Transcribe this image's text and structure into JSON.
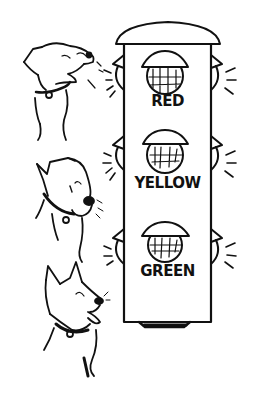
{
  "illustration": {
    "subject": "Three dogs beside a traffic light",
    "traffic_light": {
      "lights": [
        {
          "label": "RED"
        },
        {
          "label": "YELLOW"
        },
        {
          "label": "GREEN"
        }
      ]
    },
    "dogs": [
      {
        "position": "top",
        "expression": "snarling"
      },
      {
        "position": "middle",
        "expression": "worried"
      },
      {
        "position": "bottom",
        "expression": "happy-tongue-out"
      }
    ]
  },
  "colors": {
    "ink": "#111111",
    "paper": "#ffffff"
  }
}
